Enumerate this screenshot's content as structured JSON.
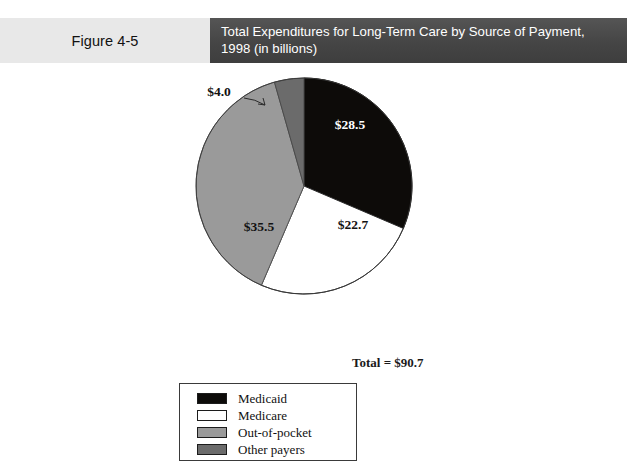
{
  "figure": {
    "number_label": "Figure 4-5",
    "title_line1": "Total Expenditures for Long-Term Care by Source of Payment,",
    "title_line2": "1998 (in billions)",
    "header_bg_light": "#e8e8e8",
    "header_bg_dark": "#4a4a4a",
    "header_text_color": "#ffffff"
  },
  "chart_data": {
    "type": "pie",
    "title": "Total Expenditures for Long-Term Care by Source of Payment, 1998 (in billions)",
    "unit": "billions of dollars",
    "total": 90.7,
    "total_label": "Total = $90.7",
    "legend_position": "bottom-left",
    "categories": [
      "Medicaid",
      "Medicare",
      "Out-of-pocket",
      "Other payers"
    ],
    "values": [
      28.5,
      22.7,
      35.5,
      4.0
    ],
    "value_labels": [
      "$28.5",
      "$22.7",
      "$35.5",
      "$4.0"
    ],
    "colors": [
      "#0d0b09",
      "#ffffff",
      "#9a9a9a",
      "#6b6b6b"
    ],
    "percentages": [
      31.4,
      25.0,
      39.1,
      4.4
    ],
    "slice_angles_deg": [
      113.1,
      90.1,
      140.9,
      15.9
    ],
    "label_placement": [
      "inside",
      "inside",
      "inside",
      "outside-leader"
    ]
  },
  "legend": {
    "items": [
      {
        "label": "Medicaid",
        "color": "#0d0b09"
      },
      {
        "label": "Medicare",
        "color": "#ffffff"
      },
      {
        "label": "Out-of-pocket",
        "color": "#9a9a9a"
      },
      {
        "label": "Other payers",
        "color": "#6b6b6b"
      }
    ]
  }
}
